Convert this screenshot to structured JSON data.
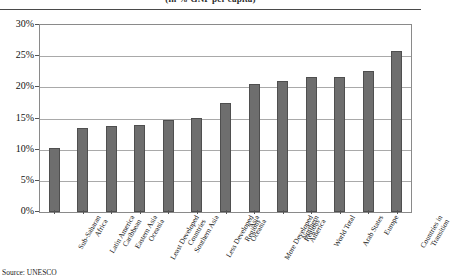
{
  "chart_data": {
    "type": "bar",
    "title": "(in % GNP per capita)",
    "xlabel": "",
    "ylabel": "",
    "ylim": [
      0,
      30
    ],
    "ytick_labels": [
      "30%",
      "25%",
      "20%",
      "15%",
      "10%",
      "5%",
      "0%"
    ],
    "ytick_values": [
      30,
      25,
      20,
      15,
      10,
      5,
      0
    ],
    "grid": true,
    "legend": "none",
    "categories": [
      "Sub-Saharan Africa",
      "Latin America Caribbean",
      "Eastern Asia Oceania",
      "Least Developed Countries",
      "Southern Asia",
      "Less Developed Regions",
      "Asia Oceania",
      "More Developed Regions",
      "Northern America",
      "World Total",
      "Arab States",
      "Europe",
      "Countries in Transition"
    ],
    "category_lines": [
      [
        "Sub-Saharan",
        "Africa"
      ],
      [
        "Latin America",
        "Caribbean"
      ],
      [
        "Eastern Asia",
        "Oceania"
      ],
      [
        "Least Developed",
        "Countries"
      ],
      [
        "Southern Asia"
      ],
      [
        "Less Developed",
        "Regions"
      ],
      [
        "Asia",
        "Oceania"
      ],
      [
        "More Developed",
        "Regions"
      ],
      [
        "Northern",
        "America"
      ],
      [
        "World Total"
      ],
      [
        "Arab States"
      ],
      [
        "Europe"
      ],
      [
        "Countries in",
        "Transition"
      ]
    ],
    "values": [
      10.4,
      13.6,
      13.9,
      14.1,
      14.9,
      15.2,
      17.6,
      20.7,
      21.2,
      21.7,
      21.8,
      22.8,
      26.0
    ],
    "bar_color": "#6e6e6e",
    "bar_edge_color": "#4f4f4f",
    "gridline_color": "#a9a9a9",
    "frame_color": "#8a8a8a"
  },
  "footer": {
    "source": "Source: UNESCO"
  }
}
